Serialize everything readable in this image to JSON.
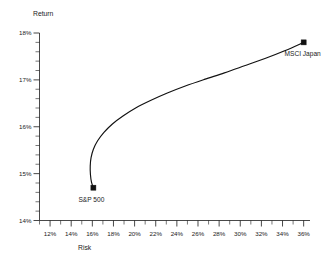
{
  "chart_data": {
    "type": "line",
    "title": "",
    "subtitle": "",
    "xlabel": "Risk",
    "ylabel": "Return",
    "xlim": [
      11.0,
      36.6
    ],
    "ylim": [
      14.0,
      18.0
    ],
    "grid": false,
    "legend": "none",
    "x_tick_labels": [
      "12%",
      "14%",
      "16%",
      "18%",
      "20%",
      "22%",
      "24%",
      "26%",
      "28%",
      "30%",
      "32%",
      "34%",
      "36%"
    ],
    "x_tick_values": [
      12,
      14,
      16,
      18,
      20,
      22,
      24,
      26,
      28,
      30,
      32,
      34,
      36
    ],
    "x_minor_step": 1,
    "y_tick_labels": [
      "14%",
      "15%",
      "16%",
      "17%",
      "18%"
    ],
    "y_tick_values": [
      14,
      15,
      16,
      17,
      18
    ],
    "y_minor_step": 0.2,
    "series": [
      {
        "name": "Efficient Frontier",
        "x": [
          16.1,
          15.92,
          15.82,
          15.8,
          15.88,
          16.1,
          16.5,
          17.1,
          17.9,
          18.9,
          20.1,
          21.5,
          23.1,
          24.8,
          26.6,
          28.5,
          30.4,
          32.4,
          34.2,
          36.0
        ],
        "y": [
          14.7,
          14.82,
          14.98,
          15.16,
          15.34,
          15.52,
          15.7,
          15.88,
          16.06,
          16.23,
          16.4,
          16.56,
          16.72,
          16.87,
          17.01,
          17.15,
          17.3,
          17.46,
          17.62,
          17.8
        ]
      }
    ],
    "annotations": [
      {
        "label": "S&P 500",
        "x": 16.1,
        "y": 14.7,
        "marker": "filled-square",
        "label_position": "below-left"
      },
      {
        "label": "MSCI Japan",
        "x": 36.0,
        "y": 17.8,
        "marker": "filled-square",
        "label_position": "below-right"
      }
    ],
    "colors": {
      "curve": "#111111",
      "marker": "#111111",
      "axis": "#1a1a1a",
      "background": "#ffffff"
    }
  }
}
